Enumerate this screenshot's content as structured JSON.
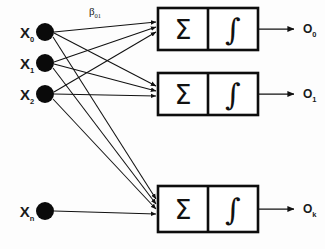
{
  "diagram": {
    "background_color": "#fdfdfd",
    "ink_color": "#111111",
    "inputs": [
      {
        "id": "x0",
        "label": "X",
        "subscript": "0",
        "cx": 45,
        "cy": 32,
        "r": 9
      },
      {
        "id": "x1",
        "label": "X",
        "subscript": "1",
        "cx": 45,
        "cy": 63,
        "r": 9
      },
      {
        "id": "x2",
        "label": "X",
        "subscript": "2",
        "cx": 45,
        "cy": 94,
        "r": 9
      },
      {
        "id": "xn",
        "label": "X",
        "subscript": "n",
        "cx": 45,
        "cy": 211,
        "r": 9
      }
    ],
    "neurons": [
      {
        "id": "neuron0",
        "sum_symbol": "Σ",
        "activation_symbol": "∫",
        "output_label": "O",
        "output_subscript": "0",
        "box_x": 158,
        "box_y": 8,
        "box_w": 100,
        "box_h": 42,
        "divider_x": 208,
        "out_arrow_x1": 258,
        "out_arrow_x2": 294,
        "out_arrow_y": 29,
        "out_label_x": 303,
        "out_label_y": 33
      },
      {
        "id": "neuron1",
        "sum_symbol": "Σ",
        "activation_symbol": "∫",
        "output_label": "O",
        "output_subscript": "1",
        "box_x": 158,
        "box_y": 73,
        "box_w": 100,
        "box_h": 42,
        "divider_x": 208,
        "out_arrow_x1": 258,
        "out_arrow_x2": 294,
        "out_arrow_y": 94,
        "out_label_x": 303,
        "out_label_y": 98
      },
      {
        "id": "neuronk",
        "sum_symbol": "Σ",
        "activation_symbol": "∫",
        "output_label": "O",
        "output_subscript": "k",
        "box_x": 158,
        "box_y": 186,
        "box_w": 100,
        "box_h": 46,
        "divider_x": 208,
        "out_arrow_x1": 258,
        "out_arrow_x2": 294,
        "out_arrow_y": 209,
        "out_label_x": 303,
        "out_label_y": 213
      }
    ],
    "weight_annotation": {
      "label": "β",
      "subscript": "01",
      "x": 95,
      "y": 15
    },
    "edges": [
      {
        "from": "x0",
        "to": "neuron0",
        "x1": 54,
        "y1": 32,
        "x2": 156,
        "y2": 22
      },
      {
        "from": "x0",
        "to": "neuron1",
        "x1": 54,
        "y1": 33,
        "x2": 156,
        "y2": 86
      },
      {
        "from": "x0",
        "to": "neuronk",
        "x1": 53,
        "y1": 37,
        "x2": 156,
        "y2": 199
      },
      {
        "from": "x1",
        "to": "neuron0",
        "x1": 54,
        "y1": 62,
        "x2": 156,
        "y2": 27
      },
      {
        "from": "x1",
        "to": "neuron1",
        "x1": 54,
        "y1": 64,
        "x2": 156,
        "y2": 91
      },
      {
        "from": "x1",
        "to": "neuronk",
        "x1": 53,
        "y1": 68,
        "x2": 156,
        "y2": 204
      },
      {
        "from": "x2",
        "to": "neuron0",
        "x1": 54,
        "y1": 92,
        "x2": 156,
        "y2": 32
      },
      {
        "from": "x2",
        "to": "neuron1",
        "x1": 54,
        "y1": 94,
        "x2": 156,
        "y2": 96
      },
      {
        "from": "x2",
        "to": "neuronk",
        "x1": 53,
        "y1": 99,
        "x2": 156,
        "y2": 209
      },
      {
        "from": "xn",
        "to": "neuronk",
        "x1": 54,
        "y1": 211,
        "x2": 156,
        "y2": 214
      }
    ]
  }
}
